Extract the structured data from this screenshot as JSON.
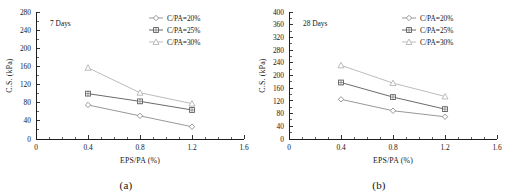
{
  "figure": {
    "panels": [
      {
        "id": "a",
        "caption": "(a)",
        "annotation": "7 Days"
      },
      {
        "id": "b",
        "caption": "(b)",
        "annotation": "28 Days"
      }
    ]
  },
  "chart_data": [
    {
      "type": "line",
      "title": "7 Days",
      "xlabel": "EPS/PA (%)",
      "ylabel": "C.S. (kPa)",
      "x": [
        0.4,
        0.8,
        1.2
      ],
      "xlim": [
        0,
        1.6
      ],
      "ylim": [
        0,
        280
      ],
      "xticks": [
        "0",
        "0.4",
        "0.8",
        "1.2",
        "1.6"
      ],
      "yticks": [
        "0",
        "40",
        "80",
        "120",
        "160",
        "200",
        "240",
        "280"
      ],
      "grid": false,
      "legend_position": "top-right",
      "series": [
        {
          "name": "C/PA=20%",
          "marker": "diamond",
          "color": "#8d8d8d",
          "values": [
            75,
            51,
            27
          ]
        },
        {
          "name": "C/PA=25%",
          "marker": "square",
          "color": "#5a5a5a",
          "values": [
            100,
            83,
            64
          ]
        },
        {
          "name": "C/PA=30%",
          "marker": "triangle",
          "color": "#b4b4b4",
          "values": [
            157,
            102,
            78
          ]
        }
      ]
    },
    {
      "type": "line",
      "title": "28 Days",
      "xlabel": "EPS/PA (%)",
      "ylabel": "C.S. (kPa)",
      "x": [
        0.4,
        0.8,
        1.2
      ],
      "xlim": [
        0,
        1.6
      ],
      "ylim": [
        0,
        400
      ],
      "xticks": [
        "0",
        "0.4",
        "0.8",
        "1.2",
        "1.6"
      ],
      "yticks": [
        "0",
        "40",
        "80",
        "120",
        "160",
        "200",
        "240",
        "280",
        "320",
        "360",
        "400"
      ],
      "grid": false,
      "legend_position": "top-right",
      "series": [
        {
          "name": "C/PA=20%",
          "marker": "diamond",
          "color": "#8d8d8d",
          "values": [
            125,
            89,
            70
          ]
        },
        {
          "name": "C/PA=25%",
          "marker": "square",
          "color": "#5a5a5a",
          "values": [
            178,
            132,
            94
          ]
        },
        {
          "name": "C/PA=30%",
          "marker": "triangle",
          "color": "#b4b4b4",
          "values": [
            232,
            176,
            134
          ]
        }
      ]
    }
  ]
}
